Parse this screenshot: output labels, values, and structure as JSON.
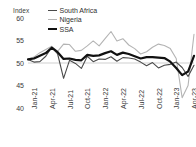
{
  "chart_data": {
    "type": "line",
    "title": "",
    "subtitle": "",
    "ylabel": "Index",
    "xlabel": "",
    "ylim": [
      40,
      60
    ],
    "yticks": [
      60,
      55,
      50,
      45,
      40
    ],
    "grid": false,
    "reference_line": {
      "value": 50,
      "color": "#cfcfcf",
      "label": ""
    },
    "legend_position": "top-left",
    "x": [
      "Jan-21",
      "Feb-21",
      "Mar-21",
      "Apr-21",
      "May-21",
      "Jun-21",
      "Jul-21",
      "Aug-21",
      "Sep-21",
      "Oct-21",
      "Nov-21",
      "Dec-21",
      "Jan-22",
      "Feb-22",
      "Mar-22",
      "Apr-22",
      "May-22",
      "Jun-22",
      "Jul-22",
      "Aug-22",
      "Sep-22",
      "Oct-22",
      "Nov-22",
      "Dec-22",
      "Jan-23",
      "Feb-23",
      "Mar-23",
      "Apr-23",
      "May-23"
    ],
    "tick_labels": [
      "Jan-21",
      "Apr-21",
      "Jul-21",
      "Oct-21",
      "Jan-22",
      "Apr-22",
      "Jul-22",
      "Oct-22",
      "Jan-23",
      "Apr-23"
    ],
    "tick_indices": [
      0,
      3,
      6,
      9,
      12,
      15,
      18,
      21,
      24,
      27
    ],
    "series": [
      {
        "name": "South Africa",
        "color": "#4a4a4a",
        "width": 1.1,
        "values": [
          50.8,
          50.2,
          50.3,
          51.5,
          53.5,
          52.0,
          46.6,
          50.6,
          49.9,
          48.8,
          51.5,
          50.3,
          50.9,
          50.8,
          51.4,
          50.4,
          51.2,
          51.1,
          50.9,
          50.2,
          49.4,
          50.1,
          48.9,
          49.5,
          49.7,
          50.2,
          49.0,
          47.0,
          49.5
        ]
      },
      {
        "name": "Nigeria",
        "color": "#b4b4b4",
        "width": 1.1,
        "values": [
          50.9,
          51.3,
          52.3,
          53.0,
          53.7,
          52.6,
          54.2,
          54.1,
          52.6,
          52.8,
          53.8,
          54.9,
          53.8,
          55.4,
          57.0,
          54.9,
          55.4,
          54.0,
          53.2,
          52.0,
          52.5,
          53.5,
          54.2,
          53.9,
          53.2,
          51.0,
          42.3,
          45.0,
          56.4
        ]
      },
      {
        "name": "SSA",
        "color": "#111111",
        "width": 2.2,
        "values": [
          50.8,
          51.0,
          51.6,
          52.2,
          53.4,
          52.4,
          50.9,
          51.0,
          50.7,
          50.6,
          51.8,
          51.6,
          51.7,
          52.2,
          52.6,
          51.8,
          52.3,
          52.0,
          51.5,
          51.0,
          51.3,
          51.3,
          51.2,
          51.1,
          50.3,
          48.9,
          47.3,
          48.1,
          51.6
        ]
      }
    ]
  }
}
